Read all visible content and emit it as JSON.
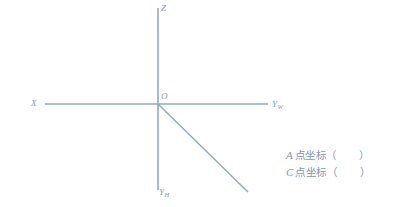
{
  "figure": {
    "title_alt": "三面投影坐标轴图",
    "background_color": "#ffffff",
    "line_color": "#8fa8c8",
    "text_color": "#7f97bb",
    "axes": {
      "vertical": {
        "x": 158,
        "y1": 8,
        "y2": 190
      },
      "horizontal": {
        "y": 104,
        "x1": 45,
        "x2": 268
      },
      "diagonal": {
        "x1": 158,
        "y1": 104,
        "x2": 248,
        "y2": 192
      }
    },
    "labels": {
      "z": "Z",
      "origin": "O",
      "x": "X",
      "y_w_base": "Y",
      "y_w_sub": "W",
      "y_h_base": "Y",
      "y_h_sub": "H"
    }
  },
  "answers": {
    "lines": [
      {
        "point": "A",
        "text": "点坐标",
        "open_paren": "（",
        "value": "",
        "close_paren": "）"
      },
      {
        "point": "C",
        "text": "点坐标",
        "open_paren": "（",
        "value": "",
        "close_paren": "）"
      }
    ]
  }
}
